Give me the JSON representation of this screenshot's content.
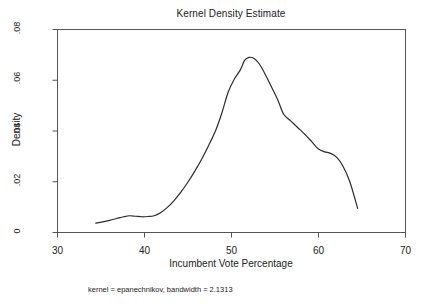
{
  "chart_data": {
    "type": "line",
    "title": "Kernel Density Estimate",
    "xlabel": "Incumbent Vote Percentage",
    "ylabel": "Density",
    "note": "kernel = epanechnikov, bandwidth = 2.1313",
    "xlim": [
      30,
      70
    ],
    "ylim": [
      0,
      0.08
    ],
    "grid": false,
    "legend": null,
    "xticks": [
      30,
      40,
      50,
      60,
      70
    ],
    "xtick_labels": [
      "30",
      "40",
      "50",
      "60",
      "70"
    ],
    "yticks": [
      0,
      0.02,
      0.04,
      0.06,
      0.08
    ],
    "ytick_labels": [
      "0",
      ".02",
      ".04",
      ".06",
      ".08"
    ],
    "series": [
      {
        "name": "Kernel density",
        "color": "#2b2b2b",
        "x": [
          34.4,
          35.2,
          36.0,
          36.8,
          37.6,
          38.3,
          39.0,
          39.7,
          40.4,
          41.1,
          41.8,
          42.6,
          43.4,
          44.2,
          45.0,
          45.8,
          46.6,
          47.4,
          48.2,
          48.9,
          49.6,
          50.3,
          51.0,
          51.5,
          52.0,
          52.6,
          53.2,
          53.9,
          54.6,
          55.3,
          56.0,
          56.8,
          57.6,
          58.4,
          59.2,
          60.0,
          60.7,
          61.4,
          62.1,
          62.8,
          63.6,
          64.5
        ],
        "y": [
          0.0037,
          0.0042,
          0.0048,
          0.0055,
          0.0062,
          0.0066,
          0.0064,
          0.0062,
          0.0063,
          0.0066,
          0.0077,
          0.0098,
          0.0126,
          0.016,
          0.0199,
          0.0243,
          0.0291,
          0.0345,
          0.0404,
          0.0472,
          0.0552,
          0.0603,
          0.064,
          0.0678,
          0.069,
          0.0686,
          0.0664,
          0.0622,
          0.0573,
          0.0524,
          0.0466,
          0.044,
          0.0414,
          0.0388,
          0.0359,
          0.0329,
          0.0318,
          0.0312,
          0.0296,
          0.0262,
          0.02,
          0.0095
        ]
      }
    ]
  }
}
